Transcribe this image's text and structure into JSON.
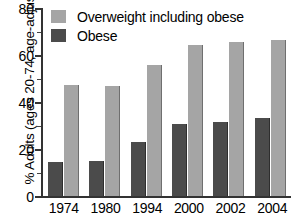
{
  "chart_data": {
    "type": "bar",
    "title": "",
    "xlabel": "",
    "ylabel": "% Adults (ages 20-74, age-adjusted)",
    "categories": [
      "1974",
      "1980",
      "1994",
      "2000",
      "2002",
      "2004"
    ],
    "series": [
      {
        "name": "Overweight including obese",
        "color": "#a5a5a5",
        "values": [
          47.4,
          47.0,
          55.9,
          64.1,
          65.4,
          66.4
        ]
      },
      {
        "name": "Obese",
        "color": "#4b4b4b",
        "values": [
          14.4,
          14.9,
          22.9,
          30.5,
          31.5,
          33.2
        ]
      }
    ],
    "ylim": [
      0,
      80
    ],
    "y_ticks_major": [
      0,
      20,
      40,
      60,
      80
    ],
    "y_ticks_minor": [
      10,
      30,
      50,
      70
    ],
    "grid": false,
    "legend_position": "top-left"
  },
  "axis": {
    "y_title": "% Adults (ages 20-74, age-adjusted)",
    "y_tick_labels": [
      "80",
      "60",
      "40",
      "20",
      "0"
    ],
    "x_tick_labels": [
      "1974",
      "1980",
      "1994",
      "2000",
      "2002",
      "2004"
    ]
  },
  "legend": {
    "items": [
      {
        "label": "Overweight including obese",
        "swatch": "overweight"
      },
      {
        "label": "Obese",
        "swatch": "obese"
      }
    ]
  },
  "colors": {
    "overweight": "#a5a5a5",
    "obese": "#4b4b4b",
    "axis": "#333333",
    "background": "#ffffff"
  }
}
